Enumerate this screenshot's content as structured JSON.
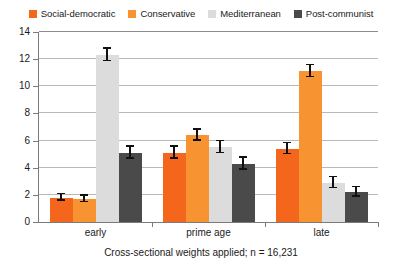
{
  "chart_data": {
    "type": "bar",
    "title": "",
    "subtitle": "",
    "xlabel": "",
    "ylabel": "",
    "caption": "Cross-sectional weights applied; n = 16,231",
    "categories": [
      "early",
      "prime age",
      "late"
    ],
    "ylim": [
      0,
      14
    ],
    "yticks": [
      0,
      2,
      4,
      6,
      8,
      10,
      12,
      14
    ],
    "ytick_labels": [
      "0",
      "2",
      "4",
      "6",
      "8",
      "10",
      "12",
      "14"
    ],
    "grid": true,
    "legend_position": "top-center",
    "series": [
      {
        "name": "Social-democratic",
        "color": "#F4661B",
        "values": [
          1.8,
          5.1,
          5.4
        ],
        "errors": [
          0.25,
          0.45,
          0.4
        ]
      },
      {
        "name": "Conservative",
        "color": "#F79331",
        "values": [
          1.7,
          6.4,
          11.1
        ],
        "errors": [
          0.25,
          0.4,
          0.45
        ]
      },
      {
        "name": "Mediterranean",
        "color": "#DCDCDC",
        "values": [
          12.3,
          5.5,
          2.9
        ],
        "errors": [
          0.45,
          0.45,
          0.4
        ]
      },
      {
        "name": "Post-communist",
        "color": "#4A4A4A",
        "values": [
          5.1,
          4.3,
          2.2
        ],
        "errors": [
          0.45,
          0.45,
          0.35
        ]
      }
    ]
  }
}
